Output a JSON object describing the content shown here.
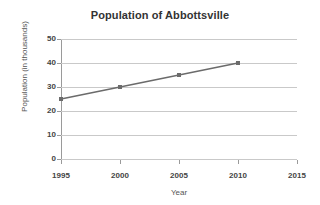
{
  "chart_data": {
    "type": "line",
    "title": "Population of Abbottsville",
    "xlabel": "Year",
    "ylabel": "Population (in thousands)",
    "x": [
      1995,
      2000,
      2005,
      2010
    ],
    "values": [
      25,
      30,
      35,
      40
    ],
    "series": [
      {
        "name": "Population",
        "x": [
          1995,
          2000,
          2005,
          2010
        ],
        "values": [
          25,
          30,
          35,
          40
        ]
      }
    ],
    "xlim": [
      1995,
      2015
    ],
    "ylim": [
      0,
      50
    ],
    "xticks": [
      1995,
      2000,
      2005,
      2010,
      2015
    ],
    "yticks": [
      0,
      10,
      20,
      30,
      40,
      50
    ],
    "xtick_labels": [
      "1995",
      "2000",
      "2005",
      "2010",
      "2015"
    ],
    "ytick_labels": [
      "0",
      "10",
      "20",
      "30",
      "40",
      "50"
    ],
    "grid": "horizontal",
    "legend": "none",
    "marker": "square",
    "line_color": "#6b6b6b",
    "marker_color": "#6b6b6b",
    "grid_color": "#c9c9c9",
    "axis_color": "#9a9a9a",
    "title_color": "#333333",
    "label_color": "#555555",
    "tick_color": "#444444",
    "background": "#ffffff"
  }
}
